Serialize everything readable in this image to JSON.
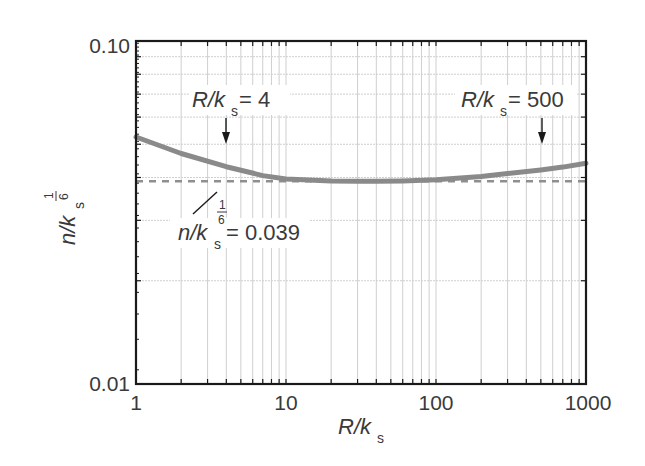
{
  "chart_data": {
    "type": "line",
    "title": "",
    "xlabel": "R/k_s",
    "ylabel": "n/k_s^(1/6)",
    "xscale": "log",
    "yscale": "log",
    "xlim": [
      1,
      1000
    ],
    "ylim": [
      0.01,
      0.1
    ],
    "grid": true,
    "x_tick_labels": [
      "1",
      "10",
      "100",
      "1000"
    ],
    "y_tick_labels": [
      "0.01",
      "0.10"
    ],
    "series": [
      {
        "name": "n/k_s^(1/6) vs R/k_s",
        "style": "solid thick gray",
        "x": [
          1,
          2,
          4,
          7,
          10,
          20,
          30,
          40,
          60,
          100,
          200,
          300,
          500,
          700,
          1000
        ],
        "values": [
          0.0525,
          0.047,
          0.043,
          0.0405,
          0.0396,
          0.0391,
          0.039,
          0.039,
          0.0391,
          0.0394,
          0.0403,
          0.0411,
          0.0421,
          0.0429,
          0.044
        ]
      },
      {
        "name": "n/k_s^(1/6) = 0.039",
        "style": "dashed gray",
        "x": [
          1,
          1000
        ],
        "values": [
          0.039,
          0.039
        ]
      }
    ],
    "annotations": [
      {
        "text": "R/k_s = 4",
        "arrow_x": 4
      },
      {
        "text": "R/k_s = 500",
        "arrow_x": 500
      },
      {
        "text": "n/k_s^(1/6) = 0.039",
        "points_to": "dashed line"
      }
    ]
  },
  "axes": {
    "y_top": "0.10",
    "y_bottom": "0.01",
    "x_ticks": [
      "1",
      "10",
      "100",
      "1000"
    ],
    "xlabel_main": "R/k",
    "xlabel_sub": "s",
    "ylabel_main": "n/k",
    "ylabel_sub": "s",
    "ylabel_exp_num": "1",
    "ylabel_exp_den": "6"
  },
  "annotations": {
    "left": {
      "main": "R/k",
      "sub": "s",
      "rest": " = 4"
    },
    "right": {
      "main": "R/k",
      "sub": "s",
      "rest": " = 500"
    },
    "bottom": {
      "main": "n/k",
      "sub": "s",
      "exp_num": "1",
      "exp_den": "6",
      "rest": " = 0.039"
    }
  },
  "colors": {
    "curve": "#8a8a8a",
    "dashed": "#8f8f8f",
    "grid": "#cfcfcf",
    "frame": "#1a1a1a",
    "text": "#3a3a3a"
  }
}
